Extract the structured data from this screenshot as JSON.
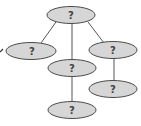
{
  "diagram": {
    "type": "tree",
    "colors": {
      "node_fill": "#d6d6d6",
      "node_stroke": "#4a4a4a",
      "edge": "#555555",
      "label": "#444444"
    },
    "nodes": [
      {
        "id": "root",
        "label": "?"
      },
      {
        "id": "left",
        "label": "?"
      },
      {
        "id": "middle",
        "label": "?"
      },
      {
        "id": "right",
        "label": "?"
      },
      {
        "id": "middle-child",
        "label": "?"
      },
      {
        "id": "right-child",
        "label": "?"
      }
    ],
    "edges": [
      {
        "from": "root",
        "to": "left"
      },
      {
        "from": "root",
        "to": "middle"
      },
      {
        "from": "root",
        "to": "right"
      },
      {
        "from": "middle",
        "to": "middle-child"
      },
      {
        "from": "right",
        "to": "right-child"
      }
    ]
  }
}
